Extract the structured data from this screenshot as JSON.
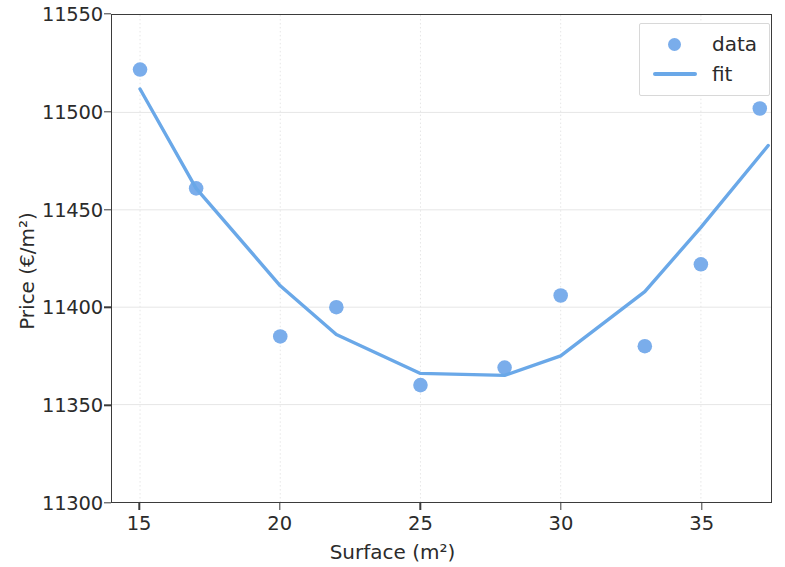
{
  "chart_data": {
    "type": "scatter",
    "title": "",
    "xlabel": "Surface (m²)",
    "ylabel": "Price (€/m²)",
    "xlim": [
      14.0,
      37.5
    ],
    "ylim": [
      11300,
      11550
    ],
    "xticks": [
      15,
      20,
      25,
      30,
      35
    ],
    "xtick_labels": [
      "15",
      "20",
      "25",
      "30",
      "35"
    ],
    "yticks": [
      11300,
      11350,
      11400,
      11450,
      11500,
      11550
    ],
    "ytick_labels": [
      "11300",
      "11350",
      "11400",
      "11450",
      "11500",
      "11550"
    ],
    "grid": true,
    "legend_position": "upper right",
    "colors": {
      "marker": "#7aadeb",
      "line": "#6aa8e8",
      "grid": "#e6e6e6",
      "axis": "#3b3b3b",
      "text": "#2b2b2b"
    },
    "series": [
      {
        "name": "data",
        "type": "scatter",
        "x": [
          15,
          17,
          20,
          22,
          25,
          28,
          30,
          33,
          35,
          37.1
        ],
        "y": [
          11522,
          11461,
          11385,
          11400,
          11360,
          11369,
          11406,
          11380,
          11422,
          11502
        ]
      },
      {
        "name": "fit",
        "type": "line",
        "x": [
          15,
          17,
          20,
          22,
          25,
          28,
          30,
          33,
          35,
          37.4
        ],
        "y": [
          11512,
          11461,
          11411,
          11386,
          11366,
          11365,
          11375,
          11408,
          11441,
          11483
        ]
      }
    ]
  },
  "legend": {
    "entries": [
      {
        "label": "data",
        "key": "marker"
      },
      {
        "label": "fit",
        "key": "line"
      }
    ]
  }
}
